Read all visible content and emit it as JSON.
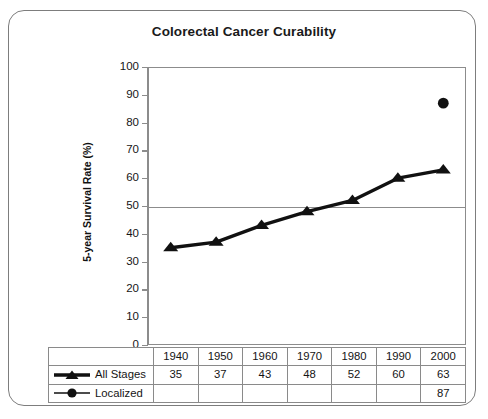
{
  "chart_data": {
    "type": "line",
    "title": "Colorectal Cancer Curability",
    "xlabel": "",
    "ylabel": "5-year Survival Rate (%)",
    "ylim": [
      0,
      100
    ],
    "ytick_step": 10,
    "yticks": [
      "100",
      "90",
      "80",
      "70",
      "60",
      "50",
      "40",
      "30",
      "20",
      "10",
      "0"
    ],
    "categories": [
      "1940",
      "1950",
      "1960",
      "1970",
      "1980",
      "1990",
      "2000"
    ],
    "grid": "horizontal line at 50 only",
    "legend_position": "table-left",
    "series": [
      {
        "name": "All Stages",
        "marker": "triangle",
        "line": "thick",
        "values": [
          35,
          37,
          43,
          48,
          52,
          60,
          63
        ]
      },
      {
        "name": "Localized",
        "marker": "circle",
        "line": "thin",
        "values": [
          null,
          null,
          null,
          null,
          null,
          null,
          87
        ]
      }
    ]
  },
  "chart": {
    "title": "Colorectal Cancer Curability",
    "y_axis_title": "5-year Survival Rate (%)"
  },
  "axis": {
    "y_ticks": [
      "100",
      "90",
      "80",
      "70",
      "60",
      "50",
      "40",
      "30",
      "20",
      "10",
      "0"
    ]
  },
  "table": {
    "years": [
      "1940",
      "1950",
      "1960",
      "1970",
      "1980",
      "1990",
      "2000"
    ],
    "rows": [
      {
        "legend": "All Stages",
        "marker": "triangle-marker-icon",
        "values": [
          "35",
          "37",
          "43",
          "48",
          "52",
          "60",
          "63"
        ]
      },
      {
        "legend": "Localized",
        "marker": "circle-marker-icon",
        "values": [
          "",
          "",
          "",
          "",
          "",
          "",
          "87"
        ]
      }
    ]
  },
  "colors": {
    "series": "#111111",
    "axis": "#8c8c8c",
    "text": "#141414",
    "frame": "#7d7d7d"
  }
}
